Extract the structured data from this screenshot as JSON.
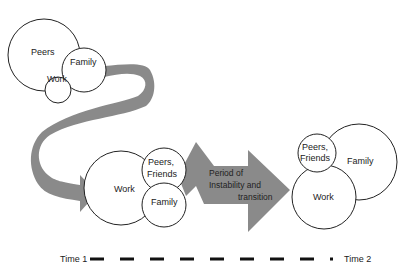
{
  "diagram": {
    "stage1": {
      "circles": [
        {
          "label": "Peers"
        },
        {
          "label": "Family"
        },
        {
          "label": "Work"
        }
      ]
    },
    "stage2": {
      "circles": [
        {
          "label": "Work"
        },
        {
          "label_line1": "Peers,",
          "label_line2": "Friends"
        },
        {
          "label": "Family"
        }
      ]
    },
    "transition": {
      "line1": "Period of",
      "line2": "Instability and",
      "line3": "transition"
    },
    "stage3": {
      "circles": [
        {
          "label": "Family"
        },
        {
          "label": "Work"
        },
        {
          "label_line1": "Peers,",
          "label_line2": "Friends"
        }
      ]
    },
    "timeline": {
      "start_label": "Time 1",
      "end_label": "Time 2"
    },
    "colors": {
      "arrow": "#8a8a8a",
      "outline": "#222222",
      "background": "#ffffff"
    }
  }
}
